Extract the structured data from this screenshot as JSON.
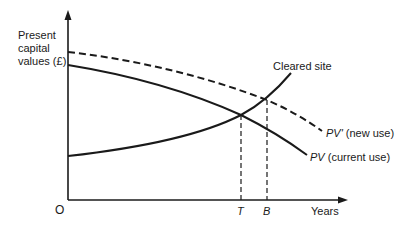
{
  "diagram": {
    "y_axis_label_lines": [
      "Present",
      "capital",
      "values (£)"
    ],
    "x_axis_label": "Years",
    "origin_label": "O",
    "markers": [
      {
        "symbol": "T",
        "x": 241
      },
      {
        "symbol": "B",
        "x": 267
      }
    ],
    "curves": [
      {
        "name": "PV' (new use)",
        "symbol": "PV'",
        "desc": "(new use)",
        "style": "dashed",
        "trend": "declining"
      },
      {
        "name": "PV (current use)",
        "symbol": "PV",
        "desc": "(current use)",
        "style": "solid",
        "trend": "declining"
      },
      {
        "name": "Cleared site",
        "style": "solid",
        "trend": "rising"
      }
    ],
    "labels": {
      "cleared_site": "Cleared site",
      "pv_new_symbol": "PV'",
      "pv_new_desc": " (new use)",
      "pv_current_symbol": "PV",
      "pv_current_desc": " (current use)",
      "t": "T",
      "b": "B"
    },
    "colors": {
      "ink": "#1a1a1a",
      "background": "#ffffff"
    }
  }
}
